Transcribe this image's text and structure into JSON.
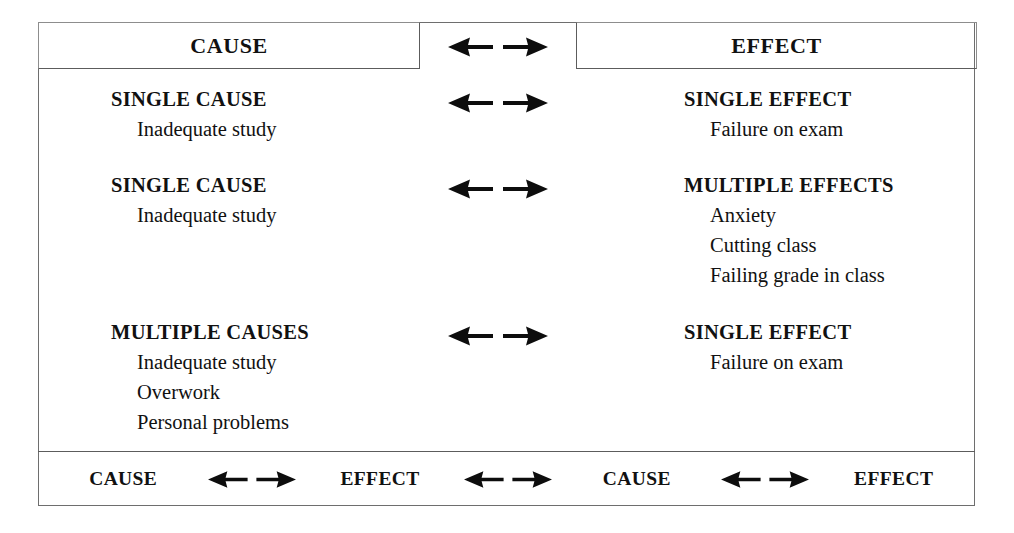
{
  "figure": {
    "kind": "cause-and-effect-relationship-chart",
    "header": {
      "cause_label": "CAUSE",
      "effect_label": "EFFECT",
      "arrow": "double-arrow-icon"
    },
    "rows": [
      {
        "cause_title": "SINGLE CAUSE",
        "cause_items": [
          "Inadequate study"
        ],
        "arrow": "double-arrow-icon",
        "effect_title": "SINGLE EFFECT",
        "effect_items": [
          "Failure on exam"
        ]
      },
      {
        "cause_title": "SINGLE CAUSE",
        "cause_items": [
          "Inadequate study"
        ],
        "arrow": "double-arrow-icon",
        "effect_title": "MULTIPLE EFFECTS",
        "effect_items": [
          "Anxiety",
          "Cutting class",
          "Failing grade in class"
        ]
      },
      {
        "cause_title": "MULTIPLE CAUSES",
        "cause_items": [
          "Inadequate study",
          "Overwork",
          "Personal problems"
        ],
        "arrow": "double-arrow-icon",
        "effect_title": "SINGLE EFFECT",
        "effect_items": [
          "Failure on exam"
        ]
      }
    ],
    "footer": {
      "sequence": [
        "CAUSE",
        "EFFECT",
        "CAUSE",
        "EFFECT"
      ],
      "arrow": "double-arrow-icon"
    },
    "colors": {
      "ink": "#111111",
      "border": "#5c5c5c",
      "background": "#ffffff"
    }
  }
}
